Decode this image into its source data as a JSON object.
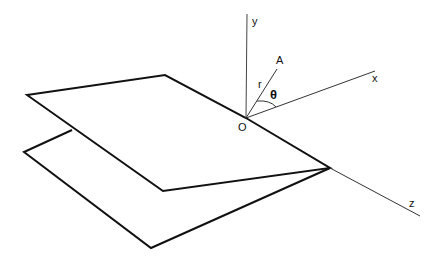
{
  "diagram": {
    "type": "3d-coordinate-geometry",
    "labels": {
      "y_axis": "y",
      "x_axis": "x",
      "z_axis": "z",
      "origin": "O",
      "point": "A",
      "radius": "r",
      "angle": "θ"
    },
    "colors": {
      "stroke": "#111111",
      "background": "#ffffff"
    }
  }
}
